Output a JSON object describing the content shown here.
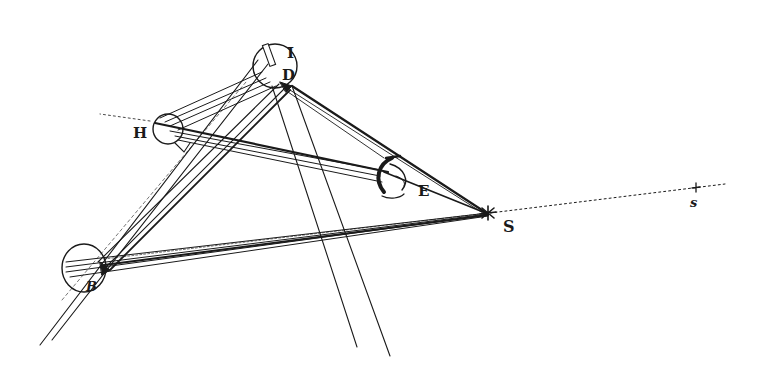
{
  "diagram": {
    "title": "",
    "style": "engraved line drawing, black ink on white",
    "colors": {
      "ink": "#1a1a1a",
      "background": "#ffffff"
    },
    "labels": {
      "I": "I",
      "D": "D",
      "H": "H",
      "E": "E",
      "S": "S",
      "B": "B",
      "s": "s"
    },
    "nodes": [
      {
        "id": "D",
        "type": "circle",
        "label": "D",
        "x": 275,
        "y": 66,
        "r": 22,
        "note": "circle with companion letter I"
      },
      {
        "id": "H",
        "type": "circle",
        "label": "H",
        "x": 168,
        "y": 129,
        "r": 15
      },
      {
        "id": "B",
        "type": "circle",
        "label": "B",
        "x": 84,
        "y": 268,
        "r": 23
      },
      {
        "id": "S",
        "type": "point",
        "label": "S",
        "x": 488,
        "y": 214
      },
      {
        "id": "E",
        "type": "eye",
        "label": "E",
        "x": 390,
        "y": 178
      },
      {
        "id": "s",
        "type": "point",
        "label": "s",
        "x": 696,
        "y": 188
      }
    ],
    "edges": [
      {
        "from": "D",
        "to": "S",
        "style": "bundle of rays"
      },
      {
        "from": "H",
        "to": "S",
        "style": "bundle of rays via E"
      },
      {
        "from": "B",
        "to": "S",
        "style": "bundle of rays"
      },
      {
        "from": "B",
        "to": "D",
        "style": "parallel tube"
      },
      {
        "from": "H",
        "to": "D",
        "style": "bundle of rays"
      },
      {
        "from": "S",
        "to": "s",
        "style": "dotted"
      },
      {
        "from": "D",
        "to": "bottom",
        "style": "two long parallel lines"
      }
    ]
  }
}
